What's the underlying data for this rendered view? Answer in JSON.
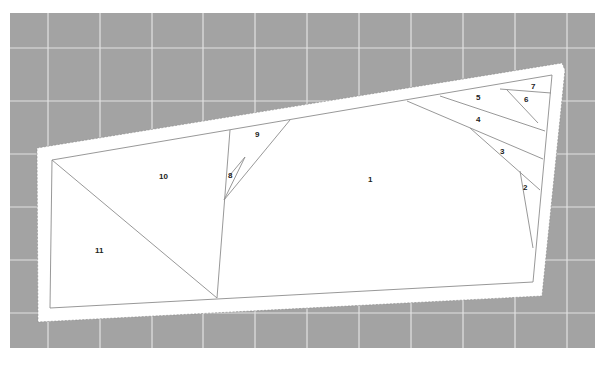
{
  "scene": {
    "description": "Paper-piecing foundation pattern on a gray cutting mat",
    "colors": {
      "mat": "#a3a3a3",
      "grid": "#e4e4e4",
      "paper": "#ffffff",
      "lines": "#8c8c8c",
      "text": "#222222"
    }
  },
  "pattern": {
    "sections": [
      {
        "id": "1",
        "label": "1",
        "x": 370,
        "y": 180
      },
      {
        "id": "2",
        "label": "2",
        "x": 526,
        "y": 188
      },
      {
        "id": "3",
        "label": "3",
        "x": 503,
        "y": 152
      },
      {
        "id": "4",
        "label": "4",
        "x": 479,
        "y": 120
      },
      {
        "id": "5",
        "label": "5",
        "x": 479,
        "y": 98
      },
      {
        "id": "6",
        "label": "6",
        "x": 527,
        "y": 100
      },
      {
        "id": "7",
        "label": "7",
        "x": 534,
        "y": 87
      },
      {
        "id": "8",
        "label": "8",
        "x": 231,
        "y": 176
      },
      {
        "id": "9",
        "label": "9",
        "x": 258,
        "y": 135
      },
      {
        "id": "10",
        "label": "10",
        "x": 164,
        "y": 177
      },
      {
        "id": "11",
        "label": "11",
        "x": 99,
        "y": 251
      }
    ]
  }
}
